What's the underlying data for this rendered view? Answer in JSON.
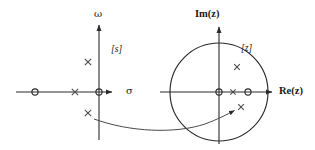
{
  "figure": {
    "background_color": "#ffffff",
    "stroke_color": "#2b2b2b",
    "width": 315,
    "height": 150
  },
  "s_plane": {
    "plane_label": "[s]",
    "vertical_axis_label": "ω",
    "horizontal_axis_label": "σ",
    "origin": {
      "x": 99,
      "y": 92
    },
    "axes": {
      "vertical": {
        "x": 99,
        "y_top": 22,
        "y_bottom": 140
      },
      "horizontal": {
        "y": 92,
        "x_left": 16,
        "x_right": 118
      }
    },
    "markers": [
      {
        "type": "zero",
        "symbol": "o",
        "x": 35,
        "y": 92,
        "name": "s-zero-real-axis"
      },
      {
        "type": "pole",
        "symbol": "x",
        "x": 75,
        "y": 92,
        "name": "s-pole-real-axis"
      },
      {
        "type": "zero",
        "symbol": "o",
        "x": 99,
        "y": 92,
        "name": "s-zero-origin"
      },
      {
        "type": "pole",
        "symbol": "x",
        "x": 88,
        "y": 62,
        "name": "s-pole-upper"
      },
      {
        "type": "pole",
        "symbol": "x",
        "x": 88,
        "y": 113,
        "name": "s-pole-lower"
      }
    ]
  },
  "z_plane": {
    "plane_label": "[z]",
    "vertical_axis_label": "Im(z)",
    "horizontal_axis_label": "Re(z)",
    "origin": {
      "x": 219,
      "y": 92
    },
    "unit_circle": {
      "cx": 219,
      "cy": 92,
      "r": 49
    },
    "axes": {
      "vertical": {
        "x": 219,
        "y_top": 24,
        "y_bottom": 144
      },
      "horizontal": {
        "y": 92,
        "x_left": 160,
        "x_right": 277
      }
    },
    "markers": [
      {
        "type": "zero",
        "symbol": "o",
        "x": 219,
        "y": 92,
        "name": "z-zero-origin"
      },
      {
        "type": "pole",
        "symbol": "x",
        "x": 233,
        "y": 92,
        "name": "z-pole-real-axis"
      },
      {
        "type": "zero",
        "symbol": "o",
        "x": 248,
        "y": 92,
        "name": "z-zero-on-unit-circle"
      },
      {
        "type": "pole",
        "symbol": "x",
        "x": 237,
        "y": 67,
        "name": "z-pole-upper"
      },
      {
        "type": "pole",
        "symbol": "x",
        "x": 241,
        "y": 107,
        "name": "z-pole-lower"
      }
    ]
  },
  "mapping_arrow": {
    "name": "mapping-arrow",
    "description": "curved arrow from s-plane lower pole to z-plane lower pole",
    "from": {
      "x": 94,
      "y": 119
    },
    "to": {
      "x": 237,
      "y": 110
    },
    "control": {
      "x": 165,
      "y": 133
    }
  }
}
